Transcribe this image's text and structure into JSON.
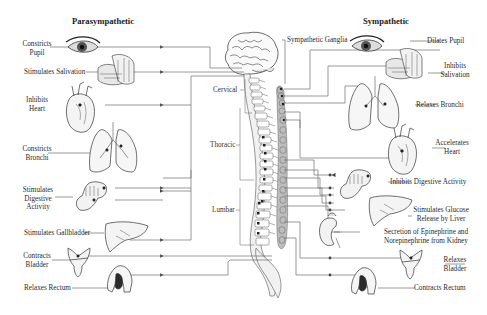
{
  "diagram": {
    "title_left": "Parasympathetic",
    "title_right": "Sympathetic",
    "ganglia_label": "Sympathetic Ganglia",
    "regions": {
      "cervical": "Cervical",
      "thoracic": "Thoracic",
      "lumbar": "Lumbar"
    },
    "parasympathetic": [
      {
        "organ": "eye-icon",
        "line1": "Constricts",
        "line2": "Pupil"
      },
      {
        "organ": "salivary-gland-icon",
        "line1": "Stimulates Salivation",
        "line2": ""
      },
      {
        "organ": "heart-icon",
        "line1": "Inhibits",
        "line2": "Heart"
      },
      {
        "organ": "lungs-icon",
        "line1": "Constricts",
        "line2": "Bronchi"
      },
      {
        "organ": "digestive-tract-icon",
        "line1": "Stimulates",
        "line2": "Digestive",
        "line3": "Activity"
      },
      {
        "organ": "liver-icon",
        "line1": "Stimulates Gallbladder",
        "line2": ""
      },
      {
        "organ": "bladder-icon",
        "line1": "Contracts",
        "line2": "Bladder"
      },
      {
        "organ": "rectum-icon",
        "line1": "Relaxes Rectum",
        "line2": ""
      }
    ],
    "sympathetic": [
      {
        "organ": "eye-icon",
        "line1": "Dilates Pupil",
        "line2": ""
      },
      {
        "organ": "salivary-gland-icon",
        "line1": "Inhibits",
        "line2": "Salivation"
      },
      {
        "organ": "lungs-icon",
        "line1": "Relaxes Bronchi",
        "line2": ""
      },
      {
        "organ": "heart-icon",
        "line1": "Accelerates",
        "line2": "Heart"
      },
      {
        "organ": "digestive-tract-icon",
        "line1": "Inhibits Digestive Activity",
        "line2": ""
      },
      {
        "organ": "liver-icon",
        "line1": "Stimulates Glucose",
        "line2": "Release by Liver"
      },
      {
        "organ": "kidney-adrenal-icon",
        "line1": "Secretion of Epinephrine and",
        "line2": "Norepinephrine from Kidney"
      },
      {
        "organ": "bladder-icon",
        "line1": "Relaxes",
        "line2": "Bladder"
      },
      {
        "organ": "rectum-icon",
        "line1": "Contracts Rectum",
        "line2": ""
      }
    ],
    "colors": {
      "line": "#6e6e6e",
      "ink": "#333333",
      "ganglia_fill": "#b9b9b9",
      "dark_fill": "#2b2b2b"
    }
  }
}
